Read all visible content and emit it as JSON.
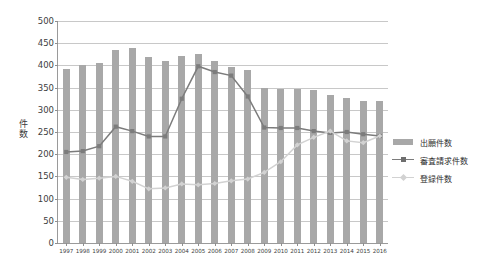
{
  "chart_data": {
    "type": "bar",
    "title": "",
    "xlabel": "",
    "ylabel": "件数",
    "ylim": [
      0,
      500
    ],
    "ytick_step": 50,
    "yticks": [
      0,
      50,
      100,
      150,
      200,
      250,
      300,
      350,
      400,
      450,
      500
    ],
    "grid": true,
    "legend_position": "right",
    "categories": [
      "1997",
      "1998",
      "1999",
      "2000",
      "2001",
      "2002",
      "2003",
      "2004",
      "2005",
      "2006",
      "2007",
      "2008",
      "2009",
      "2010",
      "2011",
      "2012",
      "2013",
      "2014",
      "2015",
      "2016"
    ],
    "series": [
      {
        "name": "出願件数",
        "type": "bar",
        "color": "#a8a8a8",
        "values": [
          391,
          400,
          405,
          435,
          439,
          420,
          411,
          422,
          426,
          409,
          396,
          390,
          350,
          347,
          346,
          345,
          334,
          327,
          320,
          319
        ]
      },
      {
        "name": "審査請求件数",
        "type": "line",
        "color": "#7c7c7c",
        "marker": "square",
        "values": [
          205,
          207,
          218,
          262,
          252,
          240,
          240,
          325,
          398,
          385,
          377,
          330,
          260,
          259,
          259,
          252,
          248,
          250,
          245,
          241
        ]
      },
      {
        "name": "登録件数",
        "type": "line",
        "color": "#d2d2d2",
        "marker": "diamond",
        "values": [
          148,
          143,
          146,
          150,
          139,
          122,
          124,
          133,
          131,
          134,
          140,
          144,
          159,
          183,
          221,
          238,
          252,
          230,
          226,
          241
        ]
      }
    ]
  },
  "legend": {
    "items": [
      {
        "label": "出願件数",
        "key": "bar"
      },
      {
        "label": "審査請求件数",
        "key": "line-dark"
      },
      {
        "label": "登録件数",
        "key": "line-light"
      }
    ]
  },
  "axis_title": {
    "chars": [
      "件",
      "数"
    ]
  }
}
